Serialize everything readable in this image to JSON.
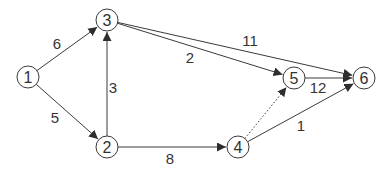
{
  "diagram": {
    "type": "directed-weighted-graph",
    "colors": {
      "stroke": "#3a3a3a",
      "text": "#333333",
      "background": "#ffffff"
    },
    "nodes": [
      {
        "id": "1",
        "label": "1",
        "x": 28,
        "y": 77
      },
      {
        "id": "2",
        "label": "2",
        "x": 107,
        "y": 147
      },
      {
        "id": "3",
        "label": "3",
        "x": 107,
        "y": 20
      },
      {
        "id": "4",
        "label": "4",
        "x": 238,
        "y": 147
      },
      {
        "id": "5",
        "label": "5",
        "x": 294,
        "y": 78
      },
      {
        "id": "6",
        "label": "6",
        "x": 364,
        "y": 78
      }
    ],
    "edges": [
      {
        "from": "1",
        "to": "3",
        "weight": "6",
        "style": "solid",
        "lx": 57,
        "ly": 43
      },
      {
        "from": "1",
        "to": "2",
        "weight": "5",
        "style": "solid",
        "lx": 55,
        "ly": 117
      },
      {
        "from": "2",
        "to": "3",
        "weight": "3",
        "style": "solid",
        "lx": 113,
        "ly": 87
      },
      {
        "from": "3",
        "to": "5",
        "weight": "2",
        "style": "solid",
        "lx": 190,
        "ly": 57
      },
      {
        "from": "3",
        "to": "6",
        "weight": "11",
        "style": "solid",
        "lx": 250,
        "ly": 40
      },
      {
        "from": "2",
        "to": "4",
        "weight": "8",
        "style": "solid",
        "lx": 170,
        "ly": 158
      },
      {
        "from": "4",
        "to": "5",
        "weight": "",
        "style": "dotted",
        "lx": 0,
        "ly": 0
      },
      {
        "from": "5",
        "to": "6",
        "weight": "12",
        "style": "solid",
        "lx": 318,
        "ly": 87
      },
      {
        "from": "4",
        "to": "6",
        "weight": "1",
        "style": "solid",
        "lx": 301,
        "ly": 125
      }
    ]
  }
}
